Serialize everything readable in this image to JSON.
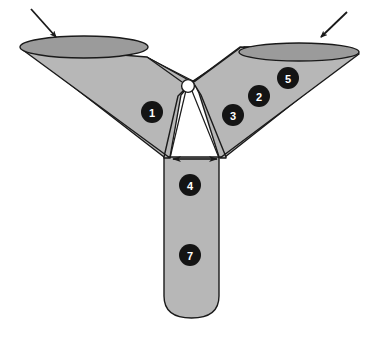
{
  "figure": {
    "background_color": "#ffffff",
    "body_fill": "#b7b7b7",
    "opening_fill": "#9b9b9b",
    "outline_color": "#1a1a1a",
    "marker_fill": "#141414",
    "marker_text_color": "#ffffff",
    "junction_fill": "#ffffff"
  },
  "parts": {
    "left_wing": {
      "name": "left funnel arm",
      "opening_label": "left inlet"
    },
    "right_wing": {
      "name": "right funnel arm",
      "opening_label": "right inlet"
    },
    "stem": {
      "name": "outlet stem"
    },
    "junction": {
      "name": "bifurcation node"
    }
  },
  "markers": [
    {
      "id": "1",
      "label": "1",
      "cx": 152,
      "cy": 112,
      "r": 11
    },
    {
      "id": "2",
      "label": "2",
      "cx": 259,
      "cy": 96,
      "r": 11
    },
    {
      "id": "3",
      "label": "3",
      "cx": 233,
      "cy": 115,
      "r": 11
    },
    {
      "id": "4",
      "label": "4",
      "cx": 190,
      "cy": 185,
      "r": 11
    },
    {
      "id": "5",
      "label": "5",
      "cx": 288,
      "cy": 78,
      "r": 11
    },
    {
      "id": "7",
      "label": "7",
      "cx": 190,
      "cy": 255,
      "r": 11
    }
  ],
  "annotations": {
    "left_inlet_arrow": {
      "name": "left inlet flow arrow",
      "from_x": 31,
      "from_y": 9,
      "to_x": 58,
      "to_y": 39
    },
    "right_inlet_arrow": {
      "name": "right inlet flow arrow",
      "from_x": 347,
      "from_y": 12,
      "to_x": 319,
      "to_y": 39
    },
    "stem_width_arrow": {
      "name": "stem diameter dimension arrow",
      "left_x": 171,
      "right_x": 219,
      "y": 159
    }
  }
}
